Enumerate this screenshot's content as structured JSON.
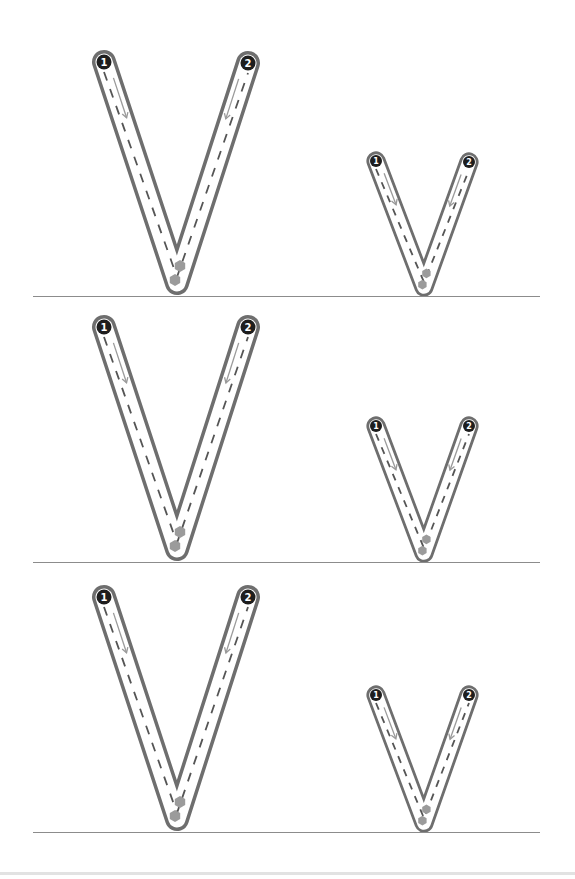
{
  "worksheet": {
    "title": "Letter V tracing practice",
    "letters": [
      "V",
      "v"
    ],
    "colors": {
      "outline": "#6e6e6e",
      "outline_inner": "#ffffff",
      "dash": "#555555",
      "arrow": "#9a9a9a",
      "start_dot": "#1e1e1e",
      "start_number": "#ffffff",
      "stop_marker": "#9b9b9b",
      "baseline": "#8c8c8c"
    },
    "rows": [
      {
        "baseline_y": 296,
        "uppercase": {
          "letter": "V",
          "start1": {
            "x": 104,
            "y": 62,
            "label": "1"
          },
          "start2": {
            "x": 248,
            "y": 63,
            "label": "2"
          },
          "bottom": {
            "x": 177,
            "y": 283
          }
        },
        "lowercase": {
          "letter": "v",
          "start1": {
            "x": 376,
            "y": 161,
            "label": "1"
          },
          "start2": {
            "x": 469,
            "y": 162,
            "label": "2"
          },
          "bottom": {
            "x": 424,
            "y": 287
          }
        }
      },
      {
        "baseline_y": 562,
        "uppercase": {
          "letter": "V",
          "start1": {
            "x": 104,
            "y": 327,
            "label": "1"
          },
          "start2": {
            "x": 248,
            "y": 327,
            "label": "2"
          },
          "bottom": {
            "x": 177,
            "y": 549
          }
        },
        "lowercase": {
          "letter": "v",
          "start1": {
            "x": 376,
            "y": 426,
            "label": "1"
          },
          "start2": {
            "x": 469,
            "y": 426,
            "label": "2"
          },
          "bottom": {
            "x": 424,
            "y": 553
          }
        }
      },
      {
        "baseline_y": 832,
        "uppercase": {
          "letter": "V",
          "start1": {
            "x": 104,
            "y": 597,
            "label": "1"
          },
          "start2": {
            "x": 248,
            "y": 597,
            "label": "2"
          },
          "bottom": {
            "x": 177,
            "y": 819
          }
        },
        "lowercase": {
          "letter": "v",
          "start1": {
            "x": 376,
            "y": 695,
            "label": "1"
          },
          "start2": {
            "x": 469,
            "y": 695,
            "label": "2"
          },
          "bottom": {
            "x": 424,
            "y": 823
          }
        }
      }
    ],
    "stroke_labels": [
      "1",
      "2"
    ]
  }
}
